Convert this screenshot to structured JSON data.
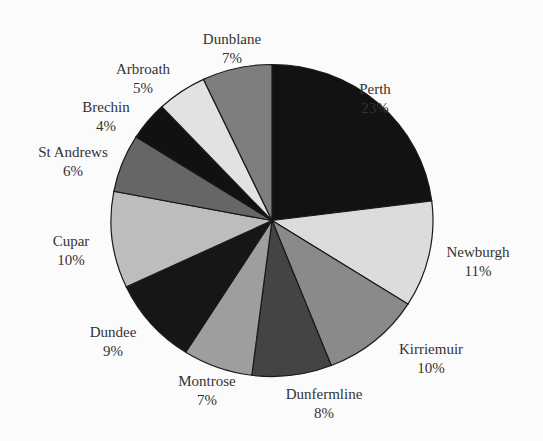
{
  "chart_data": {
    "type": "pie",
    "title": "",
    "start_angle_deg": 90,
    "direction": "clockwise",
    "categories": [
      "Perth",
      "Newburgh",
      "Kirriemuir",
      "Dunfermline",
      "Montrose",
      "Dundee",
      "Cupar",
      "St Andrews",
      "Brechin",
      "Arbroath",
      "Dunblane"
    ],
    "values": [
      23,
      11,
      10,
      8,
      7,
      9,
      10,
      6,
      4,
      5,
      7
    ],
    "value_labels": [
      "23%",
      "11%",
      "10%",
      "8%",
      "7%",
      "9%",
      "10%",
      "6%",
      "4%",
      "5%",
      "7%"
    ],
    "colors": [
      "#121212",
      "#dcdcdc",
      "#8a8a8a",
      "#444444",
      "#9e9e9e",
      "#161616",
      "#bdbdbd",
      "#666666",
      "#111111",
      "#e2e2e2",
      "#7e7e7e"
    ],
    "legend": "none"
  },
  "layout": {
    "cx": 272,
    "cy": 220.5,
    "rx": 161,
    "ry": 156,
    "label_positions": [
      {
        "x": 375,
        "y": 80
      },
      {
        "x": 478,
        "y": 243
      },
      {
        "x": 431,
        "y": 340
      },
      {
        "x": 324,
        "y": 385
      },
      {
        "x": 207,
        "y": 372
      },
      {
        "x": 113,
        "y": 323
      },
      {
        "x": 71,
        "y": 232
      },
      {
        "x": 73,
        "y": 143
      },
      {
        "x": 106,
        "y": 98
      },
      {
        "x": 143,
        "y": 60
      },
      {
        "x": 232,
        "y": 30
      }
    ]
  }
}
